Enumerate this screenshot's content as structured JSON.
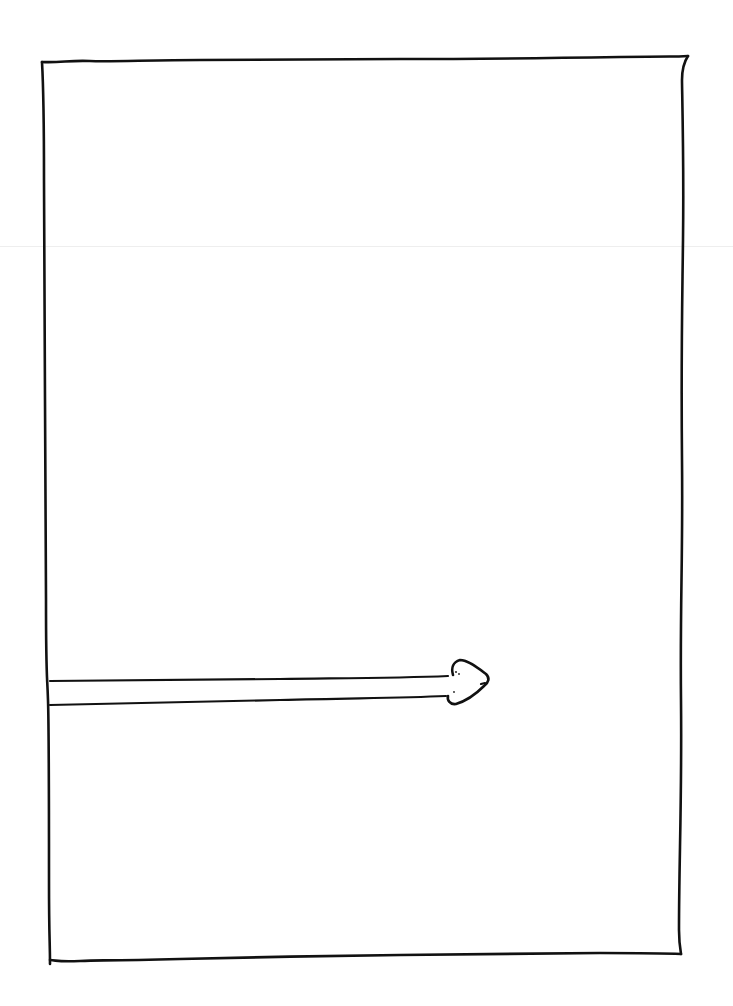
{
  "drawing": {
    "description": "Hand-drawn rectangle frame with an arrow entering from the left edge pointing right",
    "ink_color": "#111111",
    "background_color": "#ffffff",
    "frame": {
      "top_left": [
        42,
        62
      ],
      "top_right": [
        687,
        57
      ],
      "bottom_right": [
        679,
        953
      ],
      "bottom_left": [
        50,
        962
      ]
    },
    "arrow": {
      "direction": "right",
      "shaft_start_x": 55,
      "shaft_end_x": 452,
      "shaft_top_y": 681,
      "shaft_bottom_y": 704,
      "head_tip": [
        489,
        679
      ]
    }
  }
}
